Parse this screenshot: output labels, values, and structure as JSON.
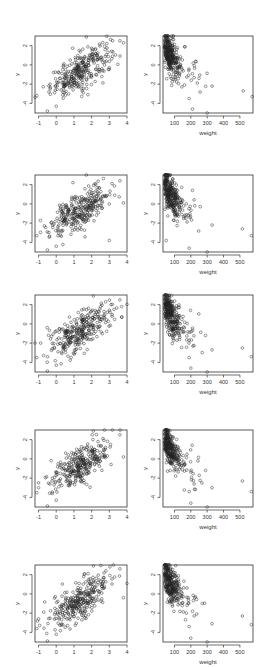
{
  "figure": {
    "layout": {
      "rows": 5,
      "cols": 2
    },
    "row_tops": [
      36,
      175,
      295,
      430,
      565
    ],
    "panel_height": 77,
    "columns": [
      {
        "left": 35,
        "width": 92
      },
      {
        "left": 163,
        "width": 90
      }
    ]
  },
  "chart_data": [
    {
      "type": "scatter",
      "panel": "row1-left",
      "title": "",
      "xlabel": "",
      "ylabel": "y",
      "xlim": [
        -1.2,
        4.0
      ],
      "ylim": [
        -5.0,
        3.0
      ],
      "grid": false,
      "xticks": [
        -1,
        0,
        1,
        2,
        3,
        4
      ],
      "yticks": [
        2,
        0,
        -2,
        -4
      ],
      "relationship": "positive linear",
      "n_points": 300,
      "sample_points": [
        [
          -1.1,
          -3.2
        ],
        [
          -0.5,
          -4.8
        ],
        [
          0.0,
          -4.3
        ],
        [
          1.7,
          2.9
        ],
        [
          3.6,
          2.5
        ],
        [
          3.8,
          2.3
        ],
        [
          0.2,
          -1.4
        ],
        [
          1.5,
          0.3
        ],
        [
          2.0,
          0.8
        ],
        [
          3.0,
          -0.3
        ]
      ]
    },
    {
      "type": "scatter",
      "panel": "row1-right",
      "title": "",
      "xlabel": "weight",
      "ylabel": "y",
      "xlim": [
        30,
        580
      ],
      "ylim": [
        -5.0,
        3.0
      ],
      "grid": false,
      "xticks": [
        100,
        200,
        300,
        400,
        500
      ],
      "yticks": [
        2,
        0,
        -2,
        -4
      ],
      "relationship": "negative, decaying with weight",
      "n_points": 300,
      "sample_points": [
        [
          50,
          2.9
        ],
        [
          60,
          2.5
        ],
        [
          80,
          -0.5
        ],
        [
          190,
          -3.5
        ],
        [
          210,
          -4.6
        ],
        [
          300,
          -5.0
        ],
        [
          330,
          -2.2
        ],
        [
          520,
          -2.7
        ],
        [
          575,
          -3.3
        ],
        [
          250,
          -1.4
        ]
      ]
    },
    {
      "type": "scatter",
      "panel": "row2-left",
      "title": "",
      "xlabel": "",
      "ylabel": "y",
      "xlim": [
        -1.2,
        4.0
      ],
      "ylim": [
        -5.0,
        3.0
      ],
      "grid": false,
      "xticks": [
        -1,
        0,
        1,
        2,
        3,
        4
      ],
      "yticks": [
        2,
        0,
        -2,
        -4
      ],
      "relationship": "positive linear",
      "n_points": 300,
      "sample_points": [
        [
          -1.1,
          -3.3
        ],
        [
          -0.5,
          -4.8
        ],
        [
          0.0,
          -4.4
        ],
        [
          1.7,
          3.0
        ],
        [
          3.6,
          2.4
        ],
        [
          3.8,
          0.1
        ],
        [
          3.0,
          -3.8
        ],
        [
          1.4,
          0.2
        ]
      ]
    },
    {
      "type": "scatter",
      "panel": "row2-right",
      "title": "",
      "xlabel": "weight",
      "ylabel": "y",
      "xlim": [
        30,
        580
      ],
      "ylim": [
        -5.0,
        3.0
      ],
      "grid": false,
      "xticks": [
        100,
        200,
        300,
        400,
        500
      ],
      "yticks": [
        2,
        0,
        -2,
        -4
      ],
      "relationship": "negative, decaying with weight",
      "n_points": 300,
      "sample_points": [
        [
          60,
          3.0
        ],
        [
          50,
          -3.8
        ],
        [
          190,
          -4.6
        ],
        [
          300,
          -5.0
        ],
        [
          330,
          -2.2
        ],
        [
          515,
          -2.6
        ],
        [
          570,
          -3.3
        ],
        [
          210,
          1.4
        ]
      ]
    },
    {
      "type": "scatter",
      "panel": "row3-left",
      "title": "",
      "xlabel": "",
      "ylabel": "y",
      "xlim": [
        -1.2,
        4.0
      ],
      "ylim": [
        -5.0,
        3.0
      ],
      "grid": false,
      "xticks": [
        -1,
        0,
        1,
        2,
        3,
        4
      ],
      "yticks": [
        2,
        0,
        -2,
        -4
      ],
      "relationship": "positive linear",
      "n_points": 300,
      "sample_points": [
        [
          -1.1,
          -3.5
        ],
        [
          -0.5,
          -4.9
        ],
        [
          0.0,
          -4.3
        ],
        [
          2.1,
          2.9
        ],
        [
          3.6,
          2.5
        ],
        [
          3.7,
          0.7
        ],
        [
          0.1,
          -2.9
        ]
      ]
    },
    {
      "type": "scatter",
      "panel": "row3-right",
      "title": "",
      "xlabel": "weight",
      "ylabel": "y",
      "xlim": [
        30,
        580
      ],
      "ylim": [
        -5.0,
        3.0
      ],
      "grid": false,
      "xticks": [
        100,
        200,
        300,
        400,
        500
      ],
      "yticks": [
        2,
        0,
        -2,
        -4
      ],
      "relationship": "negative, decaying with weight",
      "n_points": 300,
      "sample_points": [
        [
          60,
          2.9
        ],
        [
          190,
          -3.5
        ],
        [
          200,
          -4.6
        ],
        [
          300,
          -5.0
        ],
        [
          330,
          -2.7
        ],
        [
          515,
          -2.5
        ],
        [
          570,
          -3.4
        ],
        [
          290,
          -1.2
        ]
      ]
    },
    {
      "type": "scatter",
      "panel": "row4-left",
      "title": "",
      "xlabel": "",
      "ylabel": "y",
      "xlim": [
        -1.2,
        4.0
      ],
      "ylim": [
        -5.0,
        3.0
      ],
      "grid": false,
      "xticks": [
        -1,
        0,
        1,
        2,
        3,
        4
      ],
      "yticks": [
        2,
        0,
        -2,
        -4
      ],
      "relationship": "positive linear",
      "n_points": 300,
      "sample_points": [
        [
          -1.1,
          -3.5
        ],
        [
          -0.5,
          -4.9
        ],
        [
          0.0,
          -4.3
        ],
        [
          2.1,
          2.9
        ],
        [
          3.6,
          2.5
        ],
        [
          3.8,
          0.2
        ],
        [
          -1.0,
          -2.5
        ]
      ]
    },
    {
      "type": "scatter",
      "panel": "row4-right",
      "title": "",
      "xlabel": "weight",
      "ylabel": "y",
      "xlim": [
        30,
        580
      ],
      "ylim": [
        -5.0,
        3.0
      ],
      "grid": false,
      "xticks": [
        100,
        200,
        300,
        400,
        500
      ],
      "yticks": [
        2,
        0,
        -2,
        -4
      ],
      "relationship": "negative, decaying with weight",
      "n_points": 300,
      "sample_points": [
        [
          60,
          2.9
        ],
        [
          190,
          -3.4
        ],
        [
          200,
          -4.6
        ],
        [
          300,
          -5.0
        ],
        [
          330,
          -3.0
        ],
        [
          515,
          -2.3
        ],
        [
          570,
          -3.4
        ],
        [
          290,
          -1.2
        ]
      ]
    },
    {
      "type": "scatter",
      "panel": "row5-left",
      "title": "",
      "xlabel": "",
      "ylabel": "y",
      "xlim": [
        -1.2,
        4.0
      ],
      "ylim": [
        -5.0,
        3.0
      ],
      "grid": false,
      "xticks": [
        -1,
        0,
        1,
        2,
        3,
        4
      ],
      "yticks": [
        2,
        0,
        -2,
        -4
      ],
      "relationship": "positive linear",
      "n_points": 300,
      "sample_points": [
        [
          -1.1,
          -3.6
        ],
        [
          -0.5,
          -4.9
        ],
        [
          0.0,
          -4.2
        ],
        [
          2.1,
          2.9
        ],
        [
          3.6,
          2.6
        ],
        [
          3.8,
          -0.4
        ],
        [
          -1.0,
          -2.6
        ]
      ]
    },
    {
      "type": "scatter",
      "panel": "row5-right",
      "title": "",
      "xlabel": "weight",
      "ylabel": "y",
      "xlim": [
        30,
        580
      ],
      "ylim": [
        -5.0,
        3.0
      ],
      "grid": false,
      "xticks": [
        100,
        200,
        300,
        400,
        500
      ],
      "yticks": [
        2,
        0,
        -2,
        -4
      ],
      "relationship": "negative, decaying with weight",
      "n_points": 300,
      "sample_points": [
        [
          60,
          3.0
        ],
        [
          190,
          -3.4
        ],
        [
          200,
          -4.6
        ],
        [
          300,
          -5.0
        ],
        [
          330,
          -3.1
        ],
        [
          515,
          -2.3
        ],
        [
          570,
          -3.2
        ],
        [
          270,
          -1.0
        ]
      ]
    }
  ]
}
